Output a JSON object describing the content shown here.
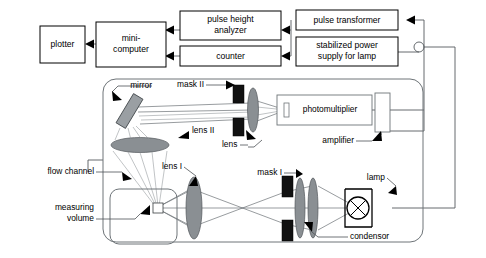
{
  "diagram": {
    "canvas": {
      "width": 486,
      "height": 258
    },
    "colors": {
      "wire": "#555a5e",
      "ray": "#6b7175",
      "lens_fill": "#8a8f93",
      "mask_fill": "#111111",
      "mirror_fill": "#9a9fa3",
      "panel_stroke": "#6e7478",
      "box_stroke": "#000000",
      "background": "#ffffff"
    },
    "blocks": [
      {
        "id": "plotter",
        "label": "plotter",
        "lines": [
          "plotter"
        ],
        "x": 40,
        "y": 26,
        "w": 45,
        "h": 37
      },
      {
        "id": "mini-computer",
        "label": "mini-computer",
        "lines": [
          "mini-",
          "computer"
        ],
        "x": 96,
        "y": 22,
        "w": 70,
        "h": 45
      },
      {
        "id": "pulse-height-analyzer",
        "label": "pulse height analyzer",
        "lines": [
          "pulse height",
          "analyzer"
        ],
        "x": 180,
        "y": 11,
        "w": 101,
        "h": 29
      },
      {
        "id": "counter",
        "label": "counter",
        "lines": [
          "counter"
        ],
        "x": 180,
        "y": 46,
        "w": 101,
        "h": 20
      },
      {
        "id": "pulse-transformer",
        "label": "pulse transformer",
        "lines": [
          "pulse transformer"
        ],
        "x": 296,
        "y": 10,
        "w": 102,
        "h": 20
      },
      {
        "id": "stabilized-power-supply",
        "label": "stabilized power supply for lamp",
        "lines": [
          "stabilized power",
          "supply for lamp"
        ],
        "x": 296,
        "y": 37,
        "w": 102,
        "h": 29
      },
      {
        "id": "photomultiplier",
        "label": "photomultiplier",
        "lines": [
          "photomultiplier"
        ],
        "x": 277,
        "y": 95,
        "w": 95,
        "h": 30
      }
    ],
    "optics_panel": {
      "x": 103,
      "y": 79,
      "w": 320,
      "h": 163,
      "corner_radius": 13
    },
    "components": [
      {
        "id": "mirror",
        "label": "mirror",
        "type": "tilted-plate"
      },
      {
        "id": "lens-ii",
        "label": "lens II",
        "type": "lens"
      },
      {
        "id": "mask-ii",
        "label": "mask II",
        "type": "aperture-stop"
      },
      {
        "id": "lens",
        "label": "lens",
        "type": "lens"
      },
      {
        "id": "amplifier",
        "label": "amplifier",
        "type": "module"
      },
      {
        "id": "flow-channel",
        "label": "flow channel",
        "type": "channel"
      },
      {
        "id": "measuring-volume",
        "label": "measuring volume",
        "lines": [
          "measuring",
          "volume"
        ],
        "type": "volume"
      },
      {
        "id": "lens-i",
        "label": "lens I",
        "type": "lens"
      },
      {
        "id": "mask-i",
        "label": "mask I",
        "type": "aperture-stop"
      },
      {
        "id": "condensor",
        "label": "condensor",
        "type": "lens-pair"
      },
      {
        "id": "lamp",
        "label": "lamp",
        "type": "source"
      }
    ],
    "callouts": [
      {
        "id": "mirror",
        "text": "mirror",
        "x": 152,
        "y": 86,
        "anchor": "end"
      },
      {
        "id": "mask-ii",
        "text": "mask II",
        "x": 203,
        "y": 85,
        "anchor": "end"
      },
      {
        "id": "lens-ii",
        "text": "lens II",
        "x": 192,
        "y": 131,
        "anchor": "start"
      },
      {
        "id": "lens",
        "text": "lens",
        "x": 222,
        "y": 145,
        "anchor": "start"
      },
      {
        "id": "photomultiplier",
        "text": "photomultiplier",
        "x": 324,
        "y": 110,
        "anchor": "middle"
      },
      {
        "id": "amplifier",
        "text": "amplifier",
        "x": 352,
        "y": 141,
        "anchor": "end"
      },
      {
        "id": "flow-channel",
        "text": "flow channel",
        "x": 92,
        "y": 172,
        "anchor": "end"
      },
      {
        "id": "measuring-volume-1",
        "text": "measuring",
        "x": 92,
        "y": 208,
        "anchor": "end"
      },
      {
        "id": "measuring-volume-2",
        "text": "volume",
        "x": 92,
        "y": 219,
        "anchor": "end"
      },
      {
        "id": "lens-i",
        "text": "lens I",
        "x": 180,
        "y": 167,
        "anchor": "end"
      },
      {
        "id": "mask-i",
        "text": "mask I",
        "x": 281,
        "y": 173,
        "anchor": "end"
      },
      {
        "id": "lamp",
        "text": "lamp",
        "x": 383,
        "y": 178,
        "anchor": "end"
      },
      {
        "id": "condensor",
        "text": "condensor",
        "x": 350,
        "y": 237,
        "anchor": "start"
      }
    ],
    "signal_flow": [
      {
        "from": "pulse-height-analyzer",
        "to": "mini-computer"
      },
      {
        "from": "counter",
        "to": "mini-computer"
      },
      {
        "from": "mini-computer",
        "to": "plotter"
      },
      {
        "from": "amplifier",
        "to": "pulse-transformer"
      },
      {
        "from": "pulse-transformer",
        "to": "pulse-height-analyzer"
      },
      {
        "from": "pulse-transformer",
        "to": "counter"
      },
      {
        "from": "stabilized-power-supply",
        "to": "lamp"
      }
    ]
  }
}
